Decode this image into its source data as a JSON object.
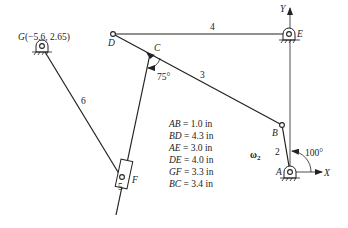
{
  "diagram": {
    "type": "planar mechanism linkage",
    "points": {
      "G": {
        "label": "G",
        "coords_label": "(−5.6, 2.65)"
      },
      "D": {
        "label": "D"
      },
      "C": {
        "label": "C"
      },
      "E": {
        "label": "E"
      },
      "B": {
        "label": "B"
      },
      "A": {
        "label": "A"
      },
      "F": {
        "label": "F"
      }
    },
    "links": {
      "l2": "2",
      "l3": "3",
      "l4": "4",
      "l5": "5",
      "l6": "6"
    },
    "angles": {
      "at_C": "75°",
      "at_A": "100°"
    },
    "axes": {
      "x": "X",
      "y": "Y"
    },
    "omega": {
      "symbol": "ω",
      "subscript": "2"
    },
    "specs": [
      {
        "name": "AB",
        "value": "= 1.0 in"
      },
      {
        "name": "BD",
        "value": "= 4.3 in"
      },
      {
        "name": "AE",
        "value": "= 3.0 in"
      },
      {
        "name": "DE",
        "value": "= 4.0 in"
      },
      {
        "name": "GF",
        "value": "= 3.3 in"
      },
      {
        "name": "BC",
        "value": "= 3.4 in"
      }
    ]
  }
}
